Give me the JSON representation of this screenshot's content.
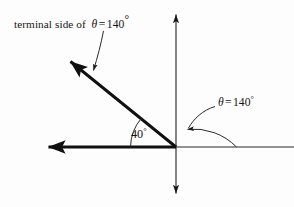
{
  "figure": {
    "type": "angle-diagram",
    "background_color": "#fdfdfd",
    "ink_color": "#151515",
    "width": 294,
    "height": 207,
    "origin": {
      "x": 176,
      "y": 147
    },
    "labels": {
      "terminal_side": {
        "prefix": "terminal side of",
        "theta_symbol": "θ",
        "equals": "=",
        "value": "140",
        "degree_symbol": "°",
        "full_text": "terminal side of θ = 140°"
      },
      "theta_angle": {
        "theta_symbol": "θ",
        "equals": "=",
        "value": "140",
        "degree_symbol": "°",
        "full_text": "θ = 140°"
      },
      "reference_angle": {
        "value": "40",
        "degree_symbol": "°",
        "full_text": "40°"
      }
    },
    "elements": {
      "x_axis": {
        "name": "horizontal-axis",
        "from_x": 44,
        "to_x": 294,
        "y": 147
      },
      "y_axis": {
        "name": "vertical-axis",
        "x": 176,
        "from_y": 12,
        "to_y": 196
      },
      "terminal_ray": {
        "name": "terminal-side-ray",
        "from_x": 176,
        "from_y": 147,
        "to_x": 66,
        "to_y": 58,
        "angle_degrees": 140
      },
      "negative_x_ray": {
        "name": "negative-x-ray",
        "from_x": 176,
        "from_y": 147,
        "to_x": 44,
        "to_y": 147
      },
      "arc_40": {
        "name": "reference-angle-arc",
        "radius": 45,
        "start_degrees": 140,
        "end_degrees": 180
      },
      "arc_140": {
        "name": "theta-angle-arc",
        "radius": 60,
        "start_degrees": 0,
        "end_degrees": 140
      },
      "leader_terminal": {
        "name": "terminal-label-leader"
      },
      "leader_theta": {
        "name": "theta-label-leader"
      }
    }
  }
}
